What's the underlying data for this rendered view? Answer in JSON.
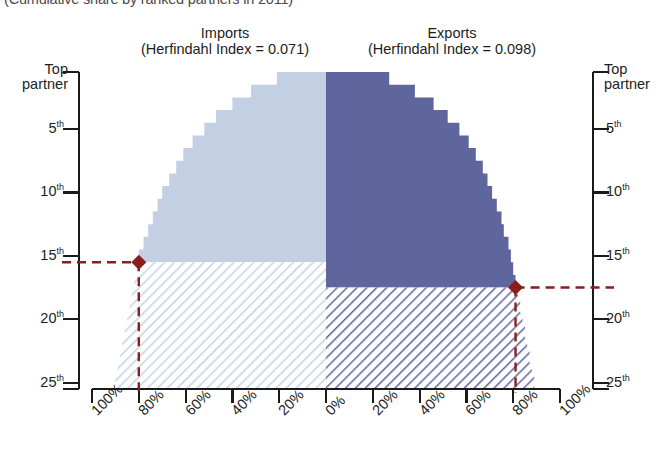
{
  "header": {
    "top_title": "(Cumulative share by ranked partners in 2011)"
  },
  "panels": {
    "left": {
      "name": "Imports",
      "subtitle": "(Herfindahl Index = 0.071)"
    },
    "right": {
      "name": "Exports",
      "subtitle": "(Herfindahl Index = 0.098)"
    }
  },
  "axes": {
    "y_left": {
      "top_label_line1": "Top",
      "top_label_line2": "partner",
      "ticks": [
        "5",
        "10",
        "15",
        "20",
        "25"
      ],
      "suffix": "th"
    },
    "y_right": {
      "top_label_line1": "Top",
      "top_label_line2": "partner",
      "ticks": [
        "5",
        "10",
        "15",
        "20",
        "25"
      ],
      "suffix": "th"
    },
    "x_left": [
      "100%",
      "80%",
      "60%",
      "40%",
      "20%",
      "0%"
    ],
    "x_right": [
      "20%",
      "40%",
      "60%",
      "80%",
      "100%"
    ]
  },
  "colors": {
    "imports_fill": "#c3d0e4",
    "exports_fill": "#5f669d",
    "marker": "#8a1d1d",
    "axis": "#1a1a1a",
    "hatch_light": "#c9d4e6",
    "hatch_dark": "#5f669d"
  },
  "chart_data": {
    "type": "area",
    "title": "(Cumulative share by ranked partners in 2011)",
    "xlabel": "Cumulative share of trade",
    "ylabel": "Partner rank",
    "orientation": "horizontal-back-to-back",
    "ylim": [
      1,
      25
    ],
    "xlim": [
      0,
      100
    ],
    "grid": false,
    "legend": "none",
    "series": [
      {
        "name": "Imports",
        "herfindahl_index": 0.071,
        "side": "left",
        "annotation_rank": 15,
        "annotation_share": 80,
        "ranks": [
          1,
          2,
          3,
          4,
          5,
          6,
          7,
          8,
          9,
          10,
          11,
          12,
          13,
          14,
          15,
          16,
          17,
          18,
          19,
          20,
          21,
          22,
          23,
          24,
          25
        ],
        "cumulative_share_pct": [
          21,
          32,
          40,
          47,
          52,
          57,
          61,
          64,
          67,
          70,
          72,
          74,
          76,
          78,
          80,
          81,
          82,
          83,
          84,
          85,
          86,
          87,
          88,
          89,
          90
        ]
      },
      {
        "name": "Exports",
        "herfindahl_index": 0.098,
        "side": "right",
        "annotation_rank": 17,
        "annotation_share": 81,
        "ranks": [
          1,
          2,
          3,
          4,
          5,
          6,
          7,
          8,
          9,
          10,
          11,
          12,
          13,
          14,
          15,
          16,
          17,
          18,
          19,
          20,
          21,
          22,
          23,
          24,
          25
        ],
        "cumulative_share_pct": [
          27,
          38,
          46,
          52,
          57,
          61,
          64,
          67,
          69,
          71,
          73,
          75,
          76,
          78,
          79,
          80,
          81,
          82,
          83,
          84,
          85,
          86,
          87,
          88,
          89
        ]
      }
    ],
    "markers": [
      {
        "series": "Imports",
        "rank": 15,
        "share_pct": 80,
        "label": "15th partner at ~80%"
      },
      {
        "series": "Exports",
        "rank": 17,
        "share_pct": 81,
        "label": "17th partner at ~80%"
      }
    ]
  }
}
